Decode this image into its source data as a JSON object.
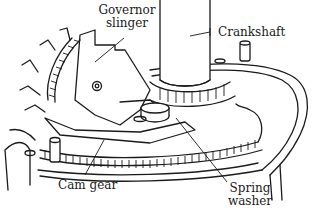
{
  "diagram": {
    "type": "technical-illustration",
    "labels": {
      "governor_slinger_line1": "Governor",
      "governor_slinger_line2": "slinger",
      "crankshaft": "Crankshaft",
      "cam_gear": "Cam gear",
      "spring_washer_line1": "Spring",
      "spring_washer_line2": "washer"
    },
    "colors": {
      "line": "#1a1a1a",
      "background": "#ffffff"
    }
  }
}
